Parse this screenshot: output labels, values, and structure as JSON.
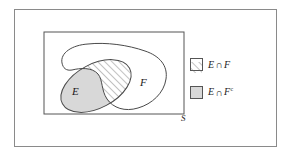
{
  "figure": {
    "type": "venn-diagram"
  },
  "diagram": {
    "sample_space_label": "S",
    "set_e_label": "E",
    "set_f_label": "F",
    "regions": [
      {
        "name": "intersection",
        "expression": "E ∩ F",
        "fill": "diagonal-hatch",
        "fill_color": "#ffffff",
        "stroke_color": "#555555"
      },
      {
        "name": "e-minus-f",
        "expression": "E ∩ Fc",
        "fill": "solid",
        "fill_color": "#d8d8d8",
        "stroke_color": "#555555"
      }
    ]
  },
  "legend": {
    "items": [
      {
        "swatch": "hatched-swatch",
        "set_a": "E",
        "operator": "∩",
        "set_b": "F",
        "superscript": ""
      },
      {
        "swatch": "gray-swatch",
        "set_a": "E",
        "operator": "∩",
        "set_b": "F",
        "superscript": "c"
      }
    ]
  },
  "colors": {
    "frame": "#8a8a8a",
    "rect_border": "#555555",
    "shape_stroke": "#4a4a4a",
    "gray_fill": "#d8d8d8",
    "hatch_line": "#666666",
    "text": "#1a1a1a"
  }
}
